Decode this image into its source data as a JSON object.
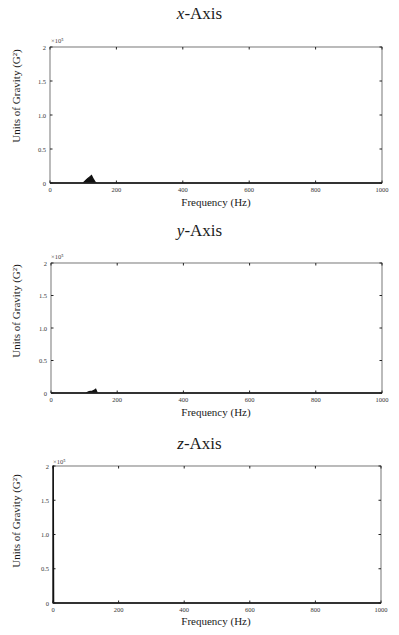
{
  "page": {
    "panels": [
      {
        "title_var": "x",
        "title_rest": "-Axis",
        "multiplier": "×10⁵"
      },
      {
        "title_var": "y",
        "title_rest": "-Axis",
        "multiplier": "×10⁵"
      },
      {
        "title_var": "z",
        "title_rest": "-Axis",
        "multiplier": "×10⁵"
      }
    ],
    "ylabel": "Units of Gravity (G²)",
    "xlabel": "Frequency (Hz)"
  },
  "chart_data": [
    {
      "type": "area",
      "title": "x-Axis",
      "xlabel": "Frequency (Hz)",
      "ylabel": "Units of Gravity (G²)",
      "y_multiplier": "×10^5",
      "xlim": [
        0,
        1000
      ],
      "ylim": [
        0,
        2
      ],
      "x_ticks": [
        0,
        200,
        400,
        600,
        800,
        1000
      ],
      "y_ticks": [
        0,
        0.5,
        1.0,
        1.5,
        2
      ],
      "grid": false,
      "series": [
        {
          "name": "PSD x",
          "x": [
            0,
            100,
            110,
            115,
            120,
            125,
            130,
            135,
            140,
            1000
          ],
          "values": [
            0,
            0,
            0.05,
            0.07,
            0.09,
            0.11,
            0.06,
            0.02,
            0,
            0
          ]
        }
      ]
    },
    {
      "type": "area",
      "title": "y-Axis",
      "xlabel": "Frequency (Hz)",
      "ylabel": "Units of Gravity (G²)",
      "y_multiplier": "×10^5",
      "xlim": [
        0,
        1000
      ],
      "ylim": [
        0,
        2
      ],
      "x_ticks": [
        0,
        200,
        400,
        600,
        800,
        1000
      ],
      "y_ticks": [
        0,
        0.5,
        1.0,
        1.5,
        2
      ],
      "grid": false,
      "series": [
        {
          "name": "PSD y",
          "x": [
            0,
            105,
            115,
            125,
            130,
            135,
            140,
            1000
          ],
          "values": [
            0,
            0,
            0.02,
            0.03,
            0.04,
            0.06,
            0,
            0
          ]
        }
      ]
    },
    {
      "type": "area",
      "title": "z-Axis",
      "xlabel": "Frequency (Hz)",
      "ylabel": "Units of Gravity (G²)",
      "y_multiplier": "×10^5",
      "xlim": [
        0,
        1000
      ],
      "ylim": [
        0,
        2
      ],
      "x_ticks": [
        0,
        200,
        400,
        600,
        800,
        1000
      ],
      "y_ticks": [
        0,
        0.5,
        1.0,
        1.5,
        2
      ],
      "grid": false,
      "series": [
        {
          "name": "PSD z",
          "x": [
            0,
            1,
            2,
            1000
          ],
          "values": [
            2,
            2,
            0,
            0
          ]
        }
      ]
    }
  ]
}
